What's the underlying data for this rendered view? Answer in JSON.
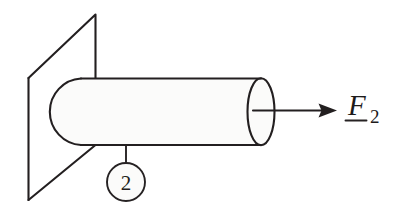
{
  "figure": {
    "background_color": "#ffffff",
    "ink_color": "#231f20",
    "body_fill_color": "#fbfbfa"
  },
  "wall": {
    "name": "wall-plane",
    "shape": "parallelogram",
    "description": "Vertical support plane drawn in oblique projection"
  },
  "cylinder": {
    "name": "cylinder-body",
    "description": "Horizontal cylindrical bar embedded in the wall",
    "right_face": "ellipse",
    "left_end": "rounded-cap"
  },
  "callout": {
    "number": "2",
    "description": "Balloon callout identifying body 2"
  },
  "force": {
    "symbol": "F",
    "subscript": "2",
    "notation": "underlined-vector",
    "direction": "right",
    "description": "Applied force F sub 2 acting along the cylinder axis"
  }
}
